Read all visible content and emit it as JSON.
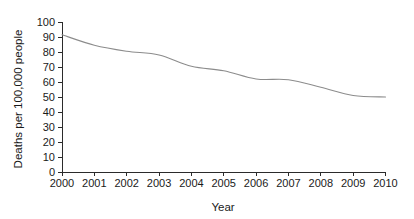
{
  "chart_data": {
    "type": "line",
    "title": "",
    "xlabel": "Year",
    "ylabel": "Deaths per 100,000 people",
    "x": [
      2000,
      2001,
      2002,
      2003,
      2004,
      2005,
      2006,
      2007,
      2008,
      2009,
      2010
    ],
    "xtick_labels": [
      "2000",
      "2001",
      "2002",
      "2003",
      "2004",
      "2005",
      "2006",
      "2007",
      "2008",
      "2009",
      "2010"
    ],
    "ytick_labels": [
      "0",
      "10",
      "20",
      "30",
      "40",
      "50",
      "60",
      "70",
      "80",
      "90",
      "100"
    ],
    "yticks": [
      0,
      10,
      20,
      30,
      40,
      50,
      60,
      70,
      80,
      90,
      100
    ],
    "xlim": [
      2000,
      2010
    ],
    "ylim": [
      0,
      100
    ],
    "grid": false,
    "legend": false,
    "series": [
      {
        "name": "Deaths per 100,000 people",
        "color": "#8c8c8c",
        "values": [
          91.5,
          84.5,
          80.5,
          78.0,
          70.5,
          67.5,
          62.0,
          61.5,
          56.5,
          51.0,
          50.0
        ]
      }
    ]
  }
}
